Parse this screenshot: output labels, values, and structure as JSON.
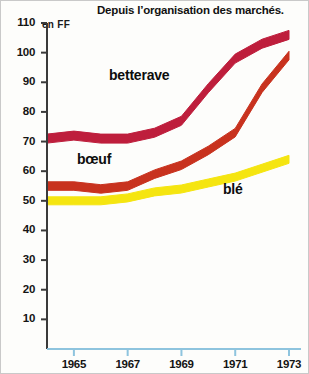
{
  "chart_data": {
    "type": "line",
    "title": "Depuis l’organisation des marchés.",
    "xlabel": "",
    "ylabel": "en FF",
    "unit_label": "en FF",
    "xlim": [
      1964,
      1973
    ],
    "ylim": [
      0,
      110
    ],
    "yticks": [
      110,
      100,
      90,
      80,
      70,
      60,
      50,
      40,
      30,
      20,
      10
    ],
    "xticks": [
      1965,
      1967,
      1969,
      1971,
      1973
    ],
    "x": [
      1964,
      1965,
      1966,
      1967,
      1968,
      1969,
      1970,
      1971,
      1972,
      1973
    ],
    "grid": false,
    "legend": "inline-labels",
    "series": [
      {
        "name": "betterave",
        "color": "#BE1E3C",
        "values": [
          71,
          72,
          71,
          71,
          73,
          77,
          88,
          98,
          103,
          106
        ]
      },
      {
        "name": "bœuf",
        "color": "#C8321E",
        "values": [
          55,
          55,
          54,
          55,
          59,
          62,
          67,
          73,
          88,
          99
        ]
      },
      {
        "name": "blé",
        "color": "#F5E510",
        "values": [
          50,
          50,
          50,
          51,
          53,
          54,
          56,
          58,
          61,
          64
        ]
      }
    ]
  },
  "axis": {
    "y_axis_color": "#3a3a3a",
    "x_axis_color": "#8ec4de",
    "tick_label_color": "#141414"
  },
  "labels": {
    "betterave": "betterave",
    "boeuf": "bœuf",
    "ble": "blé"
  }
}
